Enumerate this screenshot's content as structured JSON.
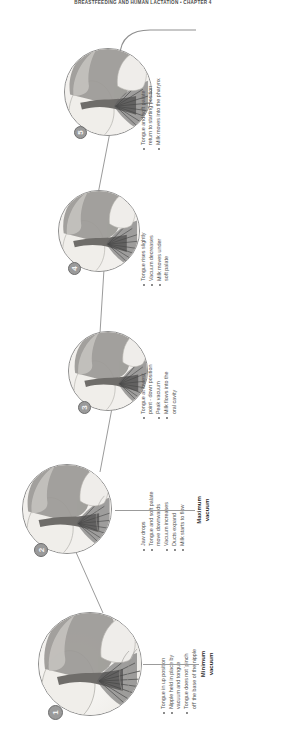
{
  "page": {
    "running_head": "BREASTFEEDING AND HUMAN LACTATION  •  CHAPTER 4"
  },
  "figure": {
    "axis": {
      "minimum_label_line1": "Minimum",
      "minimum_label_line2": "vacuum",
      "maximum_label_line1": "Maximum",
      "maximum_label_line2": "vacuum"
    },
    "stages": [
      {
        "number": "1",
        "bullets": [
          "Tongue in up position",
          "Nipple held in place by vacuum and tongue",
          "Tongue does not ‘pinch off’ the base of the nipple"
        ],
        "bullet_lines": [
          [
            "Tongue in up position"
          ],
          [
            "Nipple held in place by",
            "vacuum and tongue"
          ],
          [
            "Tongue does not ‘pinch",
            "off’ the base of the nipple"
          ]
        ]
      },
      {
        "number": "2",
        "bullets": [
          "Jaw drops",
          "Tongue and soft palate move downwards",
          "Vacuum increases",
          "Ducts expand",
          "Milk starts to flow"
        ],
        "bullet_lines": [
          [
            "Jaw drops"
          ],
          [
            "Tongue and soft palate",
            "move downwards"
          ],
          [
            "Vacuum increases"
          ],
          [
            "Ducts expand"
          ],
          [
            "Milk starts to flow"
          ]
        ]
      },
      {
        "number": "3",
        "bullets": [
          "Tongue at lowest point - down position",
          "Peak vacuum",
          "Milk flows into the oral cavity"
        ],
        "bullet_lines": [
          [
            "Tongue at lowest",
            "point - down position"
          ],
          [
            "Peak vacuum"
          ],
          [
            "Milk flows into the",
            "oral cavity"
          ]
        ]
      },
      {
        "number": "4",
        "bullets": [
          "Tongue rises slightly",
          "Vacuum decreases",
          "Milk moves under soft palate"
        ],
        "bullet_lines": [
          [
            "Tongue rises slightly"
          ],
          [
            "Vacuum decreases"
          ],
          [
            "Milk moves under",
            "soft palate"
          ]
        ]
      },
      {
        "number": "5",
        "bullets": [
          "Tongue and soft palate return to starting position",
          "Milk moves into the pharynx"
        ],
        "bullet_lines": [
          [
            "Tongue and soft palate",
            "return to starting position"
          ],
          [
            "Milk moves into the pharynx"
          ]
        ]
      }
    ],
    "colors": {
      "breast_tissue": "#cfcdc9",
      "tongue": "#6d6d6d",
      "palate": "#8c8a86",
      "outline": "#7d7d7d",
      "badge": "#9a9a9a",
      "leader": "#9b9b9b",
      "caption_text": "#555555"
    }
  }
}
